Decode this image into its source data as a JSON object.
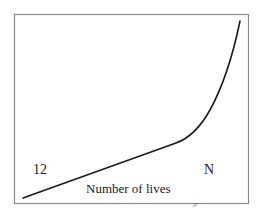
{
  "diagram": {
    "labels": {
      "start": "12",
      "end": "N",
      "axis": "Number of lives",
      "break_mark": "//"
    },
    "curve": {
      "description": "Linear rise from start then sharp upward curve near N",
      "color": "#1a1a1a"
    },
    "frame_color": "#8a8a8a"
  }
}
